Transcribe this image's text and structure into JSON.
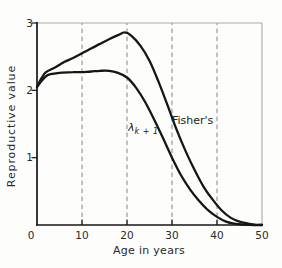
{
  "labels": {
    "lambda_base": "λ",
    "lambda_sub": "k + 1"
  },
  "chart_data": {
    "type": "line",
    "title": "",
    "xlabel": "Age in years",
    "ylabel": "Reproductive value",
    "xlim": [
      0,
      50
    ],
    "ylim": [
      0,
      3
    ],
    "x_ticks": [
      0,
      10,
      20,
      30,
      40,
      50
    ],
    "y_ticks": [
      1,
      2,
      3
    ],
    "grid": {
      "vertical_dashed_at": [
        10,
        20,
        30,
        40
      ]
    },
    "legend_position": "inline-annotations",
    "series": [
      {
        "name": "Fisher's",
        "points": [
          [
            0,
            2.05
          ],
          [
            1,
            2.18
          ],
          [
            2,
            2.27
          ],
          [
            4,
            2.34
          ],
          [
            6,
            2.42
          ],
          [
            8,
            2.48
          ],
          [
            10,
            2.55
          ],
          [
            12,
            2.62
          ],
          [
            14,
            2.69
          ],
          [
            16,
            2.76
          ],
          [
            18,
            2.82
          ],
          [
            19.5,
            2.86
          ],
          [
            21,
            2.81
          ],
          [
            23,
            2.66
          ],
          [
            25,
            2.44
          ],
          [
            27,
            2.13
          ],
          [
            29,
            1.78
          ],
          [
            31,
            1.42
          ],
          [
            33,
            1.1
          ],
          [
            35,
            0.82
          ],
          [
            37,
            0.57
          ],
          [
            39,
            0.38
          ],
          [
            41,
            0.22
          ],
          [
            43,
            0.11
          ],
          [
            45,
            0.05
          ],
          [
            47,
            0.02
          ],
          [
            48.5,
            0.005
          ],
          [
            50,
            0
          ]
        ]
      },
      {
        "name": "λk+1",
        "points": [
          [
            0,
            2.05
          ],
          [
            1,
            2.14
          ],
          [
            2,
            2.21
          ],
          [
            3,
            2.24
          ],
          [
            5,
            2.26
          ],
          [
            8,
            2.27
          ],
          [
            10,
            2.27
          ],
          [
            12,
            2.28
          ],
          [
            14,
            2.29
          ],
          [
            16,
            2.29
          ],
          [
            18,
            2.26
          ],
          [
            20,
            2.19
          ],
          [
            22,
            2.04
          ],
          [
            24,
            1.83
          ],
          [
            26,
            1.57
          ],
          [
            28,
            1.29
          ],
          [
            30,
            1.0
          ],
          [
            32,
            0.74
          ],
          [
            34,
            0.53
          ],
          [
            36,
            0.36
          ],
          [
            38,
            0.22
          ],
          [
            40,
            0.12
          ],
          [
            42,
            0.05
          ],
          [
            44,
            0.02
          ],
          [
            46,
            0.005
          ],
          [
            48,
            0
          ],
          [
            50,
            0
          ]
        ]
      }
    ],
    "colors": {
      "curve": "#161616",
      "axis": "#161616",
      "grid": "#919191",
      "frame_top_right": "#a9a9a9",
      "text": "#2a2a2a",
      "background": "#fdfdfb"
    }
  }
}
